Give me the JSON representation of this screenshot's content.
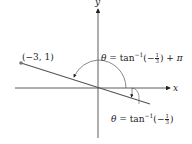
{
  "diagram": {
    "axes": {
      "x_label": "x",
      "y_label": "y"
    },
    "point": {
      "label": "(−3, 1)",
      "x": -3,
      "y": 1
    },
    "angle_large": {
      "theta": "θ",
      "equals": "=",
      "func": "tan",
      "exp": "−1",
      "open": "(",
      "sign": "−",
      "num": "1",
      "den": "3",
      "close": ")",
      "plus": "+",
      "pi": "π"
    },
    "angle_small": {
      "theta": "θ",
      "equals": "=",
      "func": "tan",
      "exp": "−1",
      "open": "(",
      "sign": "−",
      "num": "1",
      "den": "3",
      "close": ")"
    },
    "colors": {
      "axis": "#333333",
      "line": "#555555",
      "point": "#777777",
      "arc": "#555555"
    }
  }
}
